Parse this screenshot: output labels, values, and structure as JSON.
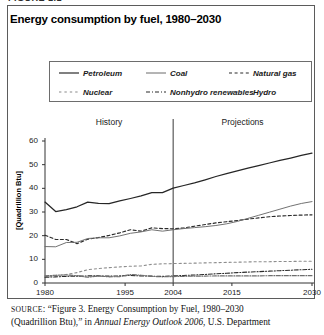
{
  "figure_tag": "FIGURE 1.1",
  "chart_title": "Energy consumption by fuel, 1980–2030",
  "legend": {
    "items": [
      {
        "label": "Petroleum",
        "style": "solid",
        "row": 1,
        "col": 1
      },
      {
        "label": "Coal",
        "style": "solid",
        "row": 1,
        "col": 2
      },
      {
        "label": "Natural gas",
        "style": "dashed",
        "row": 1,
        "col": 3
      },
      {
        "label": "Nuclear",
        "style": "dotted",
        "row": 2,
        "col": 1
      },
      {
        "label": "Nonhydro renewables",
        "style": "dashdot",
        "row": 2,
        "col": 2
      },
      {
        "label": "Hydro",
        "style": "dashdotdot",
        "row": 2,
        "col": 3
      }
    ]
  },
  "bands": {
    "history_label": "History",
    "projections_label": "Projections",
    "divider_year": 2004
  },
  "source": {
    "label": "SOURCE",
    "line1_pre": ": “Figure 3. Energy Consumption by Fuel, 1980–2030",
    "line2_pre": "(Quadrillion Btu),” in ",
    "line2_italic": "Annual Energy Outlook 2006",
    "line2_post": ", U.S. Department"
  },
  "chart_data": {
    "type": "line",
    "title": "Energy consumption by fuel, 1980–2030",
    "xlabel": "",
    "ylabel": "[Quadrillion Btu]",
    "xlim": [
      1980,
      2030
    ],
    "ylim": [
      0,
      60
    ],
    "yticks": [
      0,
      10,
      20,
      30,
      40,
      50,
      60
    ],
    "xticks": [
      1980,
      1995,
      2004,
      2015,
      2030
    ],
    "grid": false,
    "legend_position": "top",
    "annotations": [
      {
        "text": "History",
        "x": 1992
      },
      {
        "text": "Projections",
        "x": 2017
      },
      {
        "text": "divider",
        "x": 2004
      }
    ],
    "x": [
      1980,
      1982,
      1984,
      1986,
      1988,
      1990,
      1992,
      1994,
      1996,
      1998,
      2000,
      2002,
      2004,
      2006,
      2008,
      2010,
      2012,
      2014,
      2016,
      2018,
      2020,
      2022,
      2024,
      2026,
      2028,
      2030
    ],
    "series": [
      {
        "name": "Petroleum",
        "style": "solid",
        "values": [
          34.2,
          30.2,
          31.0,
          32.2,
          34.2,
          33.6,
          33.5,
          34.7,
          35.7,
          36.8,
          38.2,
          38.2,
          40.1,
          41.2,
          42.3,
          43.6,
          45.0,
          46.2,
          47.4,
          48.5,
          49.6,
          50.7,
          51.8,
          52.8,
          53.9,
          54.9
        ]
      },
      {
        "name": "Natural gas",
        "style": "dashed",
        "values": [
          20.2,
          18.4,
          18.4,
          16.6,
          18.5,
          19.2,
          20.1,
          21.2,
          22.5,
          21.9,
          23.3,
          23.0,
          22.9,
          23.3,
          24.0,
          24.7,
          25.4,
          25.9,
          26.4,
          27.0,
          27.5,
          28.0,
          28.3,
          28.5,
          28.7,
          28.8
        ]
      },
      {
        "name": "Coal",
        "style": "solid",
        "values": [
          15.4,
          15.3,
          17.1,
          17.2,
          18.8,
          19.1,
          19.1,
          19.9,
          21.0,
          21.6,
          22.5,
          21.9,
          22.5,
          23.0,
          23.4,
          23.8,
          24.3,
          25.0,
          26.0,
          27.3,
          28.6,
          29.9,
          31.2,
          32.5,
          33.6,
          34.4
        ]
      },
      {
        "name": "Nuclear",
        "style": "dotted",
        "values": [
          2.7,
          3.1,
          3.6,
          4.4,
          5.6,
          6.1,
          6.5,
          6.8,
          7.1,
          7.2,
          7.9,
          8.1,
          8.2,
          8.3,
          8.4,
          8.5,
          8.6,
          8.7,
          8.8,
          8.9,
          9.0,
          9.0,
          9.1,
          9.1,
          9.2,
          9.2
        ]
      },
      {
        "name": "Nonhydro renewables",
        "style": "dashdot",
        "values": [
          2.4,
          2.6,
          2.8,
          2.9,
          3.0,
          3.0,
          2.9,
          3.0,
          3.2,
          3.0,
          2.9,
          2.8,
          3.0,
          3.2,
          3.4,
          3.6,
          3.9,
          4.1,
          4.4,
          4.6,
          4.8,
          5.0,
          5.2,
          5.4,
          5.6,
          5.8
        ]
      },
      {
        "name": "Hydro",
        "style": "dashdotdot",
        "values": [
          3.0,
          3.3,
          3.4,
          3.1,
          2.4,
          3.0,
          2.6,
          2.7,
          3.6,
          3.3,
          2.8,
          2.6,
          2.7,
          2.8,
          2.9,
          2.9,
          3.0,
          3.0,
          3.0,
          3.0,
          3.0,
          3.1,
          3.1,
          3.1,
          3.1,
          3.1
        ]
      }
    ]
  }
}
